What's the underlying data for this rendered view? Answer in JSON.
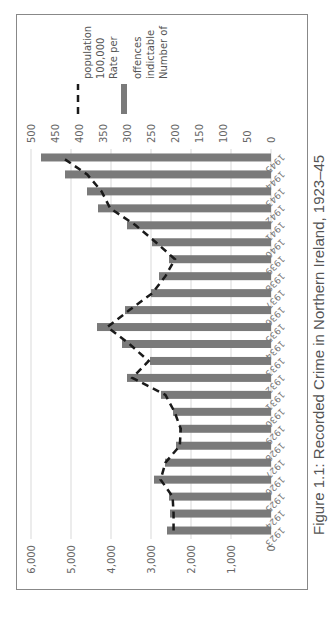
{
  "caption": "Figure 1.1: Recorded Crime in Northern Ireland, 1923–45",
  "legend": {
    "bar_label": [
      "Number of",
      "indictable",
      "offences"
    ],
    "line_label": [
      "Rate per",
      "100,000",
      "population"
    ]
  },
  "colors": {
    "bar": "#7a7a7a",
    "line": "#1a1a1a",
    "grid": "#d9d9d9"
  },
  "chart_data": {
    "type": "bar",
    "title": "Figure 1.1: Recorded Crime in Northern Ireland, 1923–45",
    "categories": [
      "1923",
      "1924",
      "1925",
      "1926",
      "1927",
      "1928",
      "1929",
      "1930",
      "1931",
      "1932",
      "1933",
      "1934",
      "1935",
      "1936",
      "1937",
      "1938",
      "1939",
      "1940",
      "1941",
      "1942",
      "1943",
      "1944",
      "1945"
    ],
    "series": [
      {
        "name": "Number of indictable offences",
        "type": "bar",
        "axis": "left",
        "values": [
          2600,
          2525,
          2550,
          2925,
          2650,
          2375,
          2300,
          2450,
          2750,
          3600,
          3025,
          3725,
          4350,
          3650,
          3000,
          2800,
          2550,
          2975,
          3600,
          4325,
          4600,
          5150,
          5750
        ]
      },
      {
        "name": "Rate per 100,000 population",
        "type": "line",
        "style": "dashed",
        "axis": "right",
        "values": [
          203,
          203,
          205,
          230,
          220,
          190,
          188,
          201,
          220,
          289,
          255,
          295,
          341,
          295,
          247,
          220,
          200,
          240,
          282,
          335,
          353,
          383,
          435
        ]
      }
    ],
    "left_axis": {
      "ylim": [
        0,
        6000
      ],
      "ticks": [
        "0",
        "1,000",
        "2,000",
        "3,000",
        "4,000",
        "5,000",
        "6,000"
      ]
    },
    "right_axis": {
      "ylim": [
        0,
        500
      ],
      "ticks": [
        "0",
        "50",
        "100",
        "150",
        "200",
        "250",
        "300",
        "350",
        "400",
        "450",
        "500"
      ]
    },
    "xlabel": "",
    "ylabel": "",
    "grid": true,
    "legend_position": "right",
    "orientation_note": "figure rotated 90° counter-clockwise on page"
  }
}
